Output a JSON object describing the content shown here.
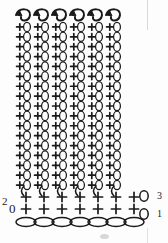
{
  "diagram": {
    "type": "crochet-stitch-chart",
    "background_color": "#fdfdfd",
    "ink_color": "#1a1a1a",
    "columns": {
      "count": 6,
      "x_positions": [
        23,
        41,
        59,
        77,
        95,
        113
      ],
      "top_y": 16,
      "bottom_y": 190,
      "segment_count": 17,
      "segment_height": 10,
      "description": "vertical strands of alternating chain loops and single crochet crosses"
    },
    "arrows": {
      "count": 6,
      "label": "turning-direction-arrow",
      "y": 16,
      "direction": "up-left"
    },
    "base_rows": [
      {
        "name": "row-2-stitches",
        "y": 197,
        "symbol": "+",
        "count": 7,
        "x_positions": [
          26,
          44,
          62,
          80,
          98,
          116,
          134
        ]
      },
      {
        "name": "row-1-stitches",
        "y": 209,
        "symbol": "+",
        "count": 7,
        "x_positions": [
          26,
          44,
          62,
          80,
          98,
          116,
          134
        ]
      }
    ],
    "foundation_chain": {
      "name": "foundation-chain",
      "y": 222,
      "count": 7,
      "x_positions": [
        26,
        44,
        62,
        80,
        98,
        116,
        134
      ],
      "oval_width": 20,
      "oval_height": 9
    },
    "turning_chains": [
      {
        "name": "turning-chain-right-row3",
        "x": 144,
        "y": 196,
        "symbol": "0"
      },
      {
        "name": "turning-chain-right-row1",
        "x": 144,
        "y": 214,
        "symbol": "0"
      }
    ],
    "hooks": {
      "count": 6,
      "x_positions": [
        21,
        39,
        57,
        75,
        93,
        111
      ],
      "y": 191,
      "symbol": "(",
      "name": "column-base-hook"
    },
    "labels": {
      "row_2": "2",
      "row_0": "0",
      "row_3": "3",
      "row_1": "1"
    }
  }
}
